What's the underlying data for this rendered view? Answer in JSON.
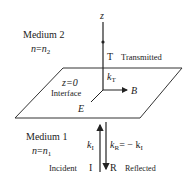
{
  "axis": {
    "label": "z"
  },
  "medium2": {
    "title": "Medium 2",
    "index_lhs": "n",
    "eq": "=",
    "index_rhs": "n",
    "index_sub": "2"
  },
  "medium1": {
    "title": "Medium 1",
    "index_lhs": "n",
    "eq": "=",
    "index_rhs": "n",
    "index_sub": "1"
  },
  "transmitted": {
    "symbol": "T",
    "label": "Transmitted",
    "k": "k",
    "k_sub": "T"
  },
  "interface": {
    "eq": "z=0",
    "label": "Interface"
  },
  "fields": {
    "B": "B",
    "E": "E"
  },
  "incident": {
    "label": "Incident",
    "symbol": "I",
    "k": "k",
    "k_sub": "I"
  },
  "reflected": {
    "symbol": "R",
    "label": "Reflected",
    "k": "k",
    "k_sub": "R",
    "relation": "= − k",
    "relation_sub": "I"
  },
  "colors": {
    "line": "#222222",
    "background": "#ffffff"
  }
}
